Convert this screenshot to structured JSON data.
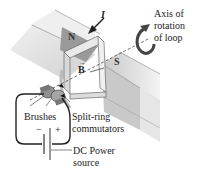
{
  "diagram": {
    "type": "dc-motor-schematic",
    "labels": {
      "north_pole": "N",
      "south_pole": "S",
      "current": "I",
      "field": "B",
      "axis": [
        "Axis of",
        "rotation",
        "of loop"
      ],
      "brushes": "Brushes",
      "commutators": [
        "Split-ring",
        "commutators"
      ],
      "power_source": [
        "DC Power",
        "source"
      ],
      "minus": "−",
      "plus": "+"
    },
    "colors": {
      "magnet_top": "#b9b9b9",
      "magnet_side": "#d9d9d9",
      "loop": "#e6e6e6",
      "line": "#222222",
      "background": "#ffffff"
    }
  }
}
